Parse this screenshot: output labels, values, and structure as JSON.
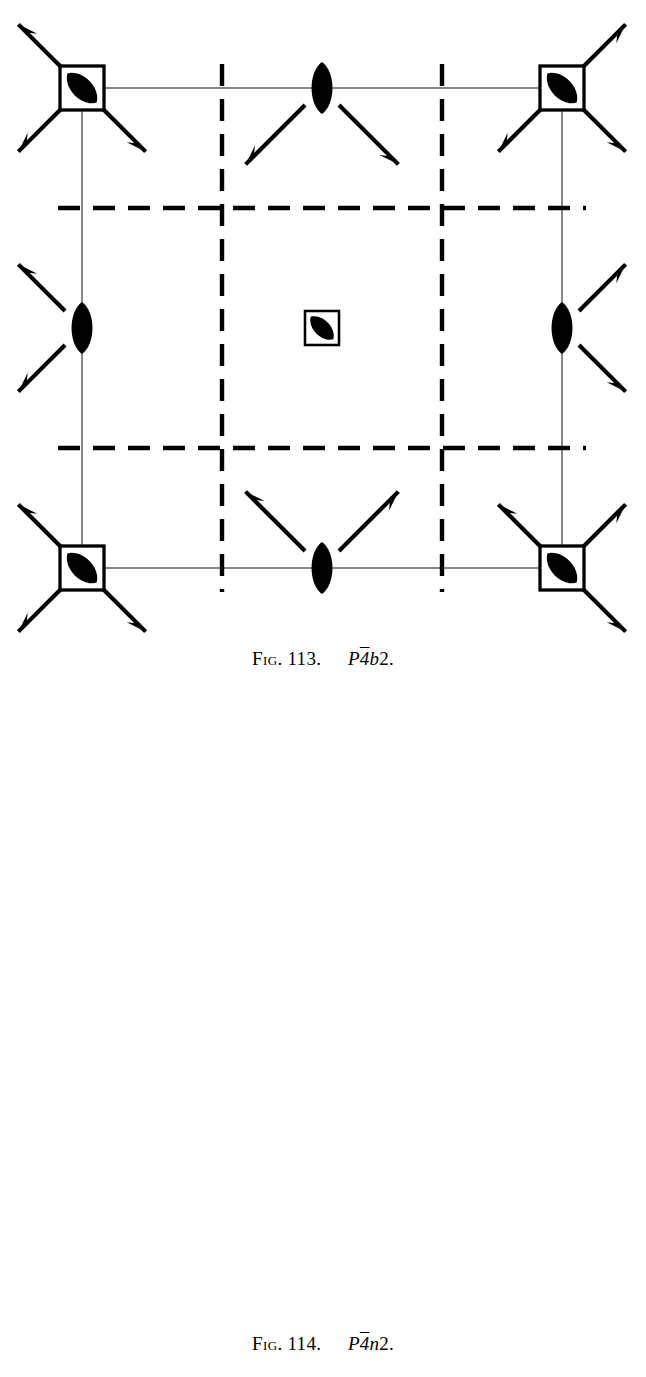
{
  "page": {
    "width": 646,
    "height": 1377,
    "background": "#ffffff",
    "ink": "#000000",
    "cell_line_color": "#6a6a6a"
  },
  "figures": [
    {
      "id": "113",
      "caption": {
        "fig_label": "Fig.",
        "number": "113.",
        "symbol_p": "P",
        "symbol_bar4": "4",
        "symbol_glide": "b",
        "symbol_two": "2",
        "symbol_period": "."
      },
      "cell": {
        "x": 82,
        "y": 88,
        "width": 480,
        "height": 480
      },
      "glide_line_style": "dashed",
      "glide_lines": {
        "vertical_x": [
          222,
          442
        ],
        "horizontal_y": [
          208,
          448
        ]
      },
      "inversion_tetrads": [
        {
          "x": 82,
          "y": 88,
          "size": 44,
          "label": "corner-top-left"
        },
        {
          "x": 562,
          "y": 88,
          "size": 44,
          "label": "corner-top-right"
        },
        {
          "x": 82,
          "y": 568,
          "size": 44,
          "label": "corner-bottom-left"
        },
        {
          "x": 562,
          "y": 568,
          "size": 44,
          "label": "corner-bottom-right"
        },
        {
          "x": 322,
          "y": 328,
          "size": 34,
          "label": "center"
        }
      ],
      "twofold_lenses": [
        {
          "x": 322,
          "y": 88,
          "label": "top-edge-midpoint"
        },
        {
          "x": 82,
          "y": 328,
          "label": "left-edge-midpoint"
        },
        {
          "x": 562,
          "y": 328,
          "label": "right-edge-midpoint"
        },
        {
          "x": 322,
          "y": 568,
          "label": "bottom-edge-midpoint"
        }
      ],
      "inplane_axes_style": "half-arrow",
      "fraction_labels": [],
      "arrows": [
        {
          "x": 82,
          "y": 88,
          "angle": 225,
          "len": 66
        },
        {
          "x": 82,
          "y": 88,
          "angle": 315,
          "len": 66
        },
        {
          "x": 82,
          "y": 88,
          "angle": 135,
          "len": 66
        },
        {
          "x": 322,
          "y": 88,
          "angle": 225,
          "len": 84
        },
        {
          "x": 322,
          "y": 88,
          "angle": 315,
          "len": 84
        },
        {
          "x": 562,
          "y": 88,
          "angle": 225,
          "len": 66
        },
        {
          "x": 562,
          "y": 88,
          "angle": 315,
          "len": 66
        },
        {
          "x": 562,
          "y": 88,
          "angle": 45,
          "len": 66
        },
        {
          "x": 82,
          "y": 328,
          "angle": 225,
          "len": 66
        },
        {
          "x": 82,
          "y": 328,
          "angle": 135,
          "len": 66
        },
        {
          "x": 562,
          "y": 328,
          "angle": 315,
          "len": 66
        },
        {
          "x": 562,
          "y": 328,
          "angle": 45,
          "len": 66
        },
        {
          "x": 82,
          "y": 568,
          "angle": 225,
          "len": 66
        },
        {
          "x": 82,
          "y": 568,
          "angle": 135,
          "len": 66
        },
        {
          "x": 82,
          "y": 568,
          "angle": 315,
          "len": 66
        },
        {
          "x": 322,
          "y": 568,
          "angle": 135,
          "len": 84
        },
        {
          "x": 322,
          "y": 568,
          "angle": 45,
          "len": 84
        },
        {
          "x": 562,
          "y": 568,
          "angle": 135,
          "len": 66
        },
        {
          "x": 562,
          "y": 568,
          "angle": 45,
          "len": 66
        },
        {
          "x": 562,
          "y": 568,
          "angle": 315,
          "len": 66
        }
      ]
    },
    {
      "id": "114",
      "caption": {
        "fig_label": "Fig.",
        "number": "114.",
        "symbol_p": "P",
        "symbol_bar4": "4",
        "symbol_glide": "n",
        "symbol_two": "2",
        "symbol_period": "."
      },
      "cell": {
        "x": 96,
        "y": 802,
        "width": 466,
        "height": 466
      },
      "glide_line_style": "dash-dot",
      "glide_lines": {
        "vertical_x": [
          213,
          447
        ],
        "horizontal_y": [
          954,
          1153
        ]
      },
      "inversion_tetrads": [
        {
          "x": 96,
          "y": 802,
          "size": 44,
          "label": "corner-top-left"
        },
        {
          "x": 562,
          "y": 802,
          "size": 44,
          "label": "corner-top-right"
        },
        {
          "x": 96,
          "y": 1268,
          "size": 44,
          "label": "corner-bottom-left"
        },
        {
          "x": 562,
          "y": 1268,
          "size": 44,
          "label": "corner-bottom-right"
        },
        {
          "x": 329,
          "y": 1035,
          "size": 34,
          "label": "center"
        }
      ],
      "twofold_lenses": [
        {
          "x": 329,
          "y": 802,
          "label": "top-edge-midpoint"
        },
        {
          "x": 96,
          "y": 1035,
          "label": "left-edge-midpoint"
        },
        {
          "x": 562,
          "y": 1035,
          "label": "right-edge-midpoint"
        },
        {
          "x": 329,
          "y": 1268,
          "label": "bottom-edge-midpoint"
        }
      ],
      "inplane_axes_style": "full-arrow",
      "fraction_label_text": "1/4",
      "fraction_numerator": "1",
      "fraction_denominator": "4",
      "arrows": [
        {
          "x": 96,
          "y": 802,
          "angle": 225,
          "len": 76,
          "frac": true
        },
        {
          "x": 96,
          "y": 802,
          "angle": 315,
          "len": 76,
          "frac": true
        },
        {
          "x": 96,
          "y": 802,
          "angle": 135,
          "len": 76,
          "frac": true
        },
        {
          "x": 329,
          "y": 802,
          "angle": 225,
          "len": 92,
          "frac": true
        },
        {
          "x": 329,
          "y": 802,
          "angle": 315,
          "len": 92,
          "frac": true
        },
        {
          "x": 562,
          "y": 802,
          "angle": 225,
          "len": 76,
          "frac": true
        },
        {
          "x": 562,
          "y": 802,
          "angle": 315,
          "len": 76,
          "frac": true
        },
        {
          "x": 562,
          "y": 802,
          "angle": 45,
          "len": 76,
          "frac": true
        },
        {
          "x": 96,
          "y": 1035,
          "angle": 225,
          "len": 76,
          "frac": true
        },
        {
          "x": 96,
          "y": 1035,
          "angle": 135,
          "len": 76,
          "frac": true
        },
        {
          "x": 562,
          "y": 1035,
          "angle": 315,
          "len": 76,
          "frac": true
        },
        {
          "x": 562,
          "y": 1035,
          "angle": 45,
          "len": 76,
          "frac": true
        },
        {
          "x": 96,
          "y": 1268,
          "angle": 225,
          "len": 76,
          "frac": true
        },
        {
          "x": 96,
          "y": 1268,
          "angle": 135,
          "len": 76,
          "frac": true
        },
        {
          "x": 96,
          "y": 1268,
          "angle": 315,
          "len": 76,
          "frac": true
        },
        {
          "x": 329,
          "y": 1268,
          "angle": 135,
          "len": 92,
          "frac": true
        },
        {
          "x": 329,
          "y": 1268,
          "angle": 45,
          "len": 92,
          "frac": true
        },
        {
          "x": 562,
          "y": 1268,
          "angle": 135,
          "len": 76,
          "frac": true
        },
        {
          "x": 562,
          "y": 1268,
          "angle": 45,
          "len": 76,
          "frac": true
        },
        {
          "x": 562,
          "y": 1268,
          "angle": 315,
          "len": 76,
          "frac": true
        }
      ]
    }
  ]
}
